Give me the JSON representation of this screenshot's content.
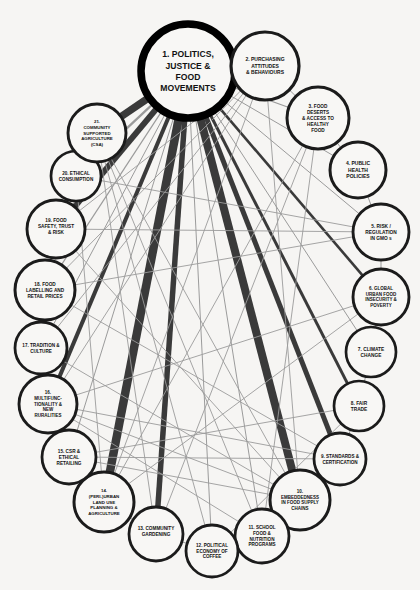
{
  "diagram": {
    "background_color": "#f6f5f3",
    "node_fill": "#f8f7f5",
    "node_stroke": "#1b1b1b",
    "hub_stroke": "#000000",
    "edge_strong_color": "#3a3a3a",
    "edge_weak_color": "#9b9b9b",
    "label_color": "#111111"
  },
  "nodes": [
    {
      "id": 1,
      "label": "1. POLITICS, JUSTICE & FOOD MOVEMENTS",
      "lines": [
        "1. POLITICS,",
        "JUSTICE &",
        "FOOD",
        "MOVEMENTS"
      ],
      "x": 188,
      "y": 71,
      "r": 47,
      "stroke_width": 7.5,
      "font_size": 8.6,
      "hub": true
    },
    {
      "id": 2,
      "label": "2. PURCHASING ATTITUDES & BEHAVIOURS",
      "lines": [
        "2. PURCHASING",
        "ATTITUDES",
        "& BEHAVIOURS"
      ],
      "x": 265,
      "y": 66,
      "r": 34,
      "stroke_width": 3.2,
      "font_size": 5.0,
      "hub": false
    },
    {
      "id": 3,
      "label": "3. FOOD DESERTS & ACCESS TO HEALTHY FOOD",
      "lines": [
        "3. FOOD",
        "DESERTS",
        "& ACCESS TO",
        "HEALTHY",
        "FOOD"
      ],
      "x": 318,
      "y": 118,
      "r": 31,
      "stroke_width": 3.0,
      "font_size": 4.7,
      "hub": false
    },
    {
      "id": 4,
      "label": "4. PUBLIC HEALTH POLICIES",
      "lines": [
        "4. PUBLIC",
        "HEALTH",
        "POLICIES"
      ],
      "x": 358,
      "y": 170,
      "r": 28,
      "stroke_width": 3.0,
      "font_size": 5.0,
      "hub": false
    },
    {
      "id": 5,
      "label": "5. RISK / REGULATION IN GMO s",
      "lines": [
        "5. RISK /",
        "REGULATION",
        "IN GMO s"
      ],
      "x": 381,
      "y": 232,
      "r": 28,
      "stroke_width": 2.9,
      "font_size": 4.8,
      "hub": false
    },
    {
      "id": 6,
      "label": "6. GLOBAL URBAN FOOD INSECURITY & POVERTY",
      "lines": [
        "6. GLOBAL",
        "URBAN FOOD",
        "INSECURITY &",
        "POVERTY"
      ],
      "x": 381,
      "y": 297,
      "r": 28,
      "stroke_width": 2.9,
      "font_size": 4.5,
      "hub": false
    },
    {
      "id": 7,
      "label": "7. CLIMATE CHANGE",
      "lines": [
        "7. CLIMATE",
        "CHANGE"
      ],
      "x": 371,
      "y": 352,
      "r": 25,
      "stroke_width": 2.7,
      "font_size": 4.8,
      "hub": false
    },
    {
      "id": 8,
      "label": "8. FAIR TRADE",
      "lines": [
        "8. FAIR",
        "TRADE"
      ],
      "x": 359,
      "y": 406,
      "r": 25,
      "stroke_width": 2.7,
      "font_size": 4.8,
      "hub": false
    },
    {
      "id": 9,
      "label": "9. STANDARDS & CERTIFICATION",
      "lines": [
        "9. STANDARDS &",
        "CERTIFICATION"
      ],
      "x": 340,
      "y": 459,
      "r": 26,
      "stroke_width": 2.8,
      "font_size": 4.6,
      "hub": false
    },
    {
      "id": 10,
      "label": "10. EMBEDDEDNESS IN FOOD SUPPLY CHAINS",
      "lines": [
        "10.",
        "EMBEDDEDNESS",
        "IN FOOD SUPPLY",
        "CHAINS"
      ],
      "x": 300,
      "y": 500,
      "r": 30,
      "stroke_width": 3.0,
      "font_size": 4.5,
      "hub": false
    },
    {
      "id": 11,
      "label": "11. SCHOOL FOOD & NUTRITION PROGRAMS",
      "lines": [
        "11. SCHOOL",
        "FOOD &",
        "NUTRITION",
        "PROGRAMS"
      ],
      "x": 262,
      "y": 536,
      "r": 27,
      "stroke_width": 2.8,
      "font_size": 4.6,
      "hub": false
    },
    {
      "id": 12,
      "label": "12. POLITICAL ECONOMY OF COFFEE",
      "lines": [
        "12. POLITICAL",
        "ECONOMY OF",
        "COFFEE"
      ],
      "x": 212,
      "y": 551,
      "r": 26,
      "stroke_width": 2.8,
      "font_size": 4.6,
      "hub": false
    },
    {
      "id": 13,
      "label": "13. COMMUNITY GARDENING",
      "lines": [
        "13. COMMUNITY",
        "GARDENING",
        ""
      ],
      "x": 156,
      "y": 534,
      "r": 27,
      "stroke_width": 2.8,
      "font_size": 4.7,
      "hub": false
    },
    {
      "id": 14,
      "label": "14. (PERI-)URBAN LAND USE PLANNING & AGRICULTURE",
      "lines": [
        "14.",
        "(PERI-)URBAN",
        "LAND USE",
        "PLANNING &",
        "AGRICULTURE"
      ],
      "x": 104,
      "y": 502,
      "r": 30,
      "stroke_width": 3.0,
      "font_size": 4.4,
      "hub": false
    },
    {
      "id": 15,
      "label": "15. CSR & ETHICAL RETAILING",
      "lines": [
        "15. CSR &",
        "ETHICAL",
        "RETAILING"
      ],
      "x": 69,
      "y": 457,
      "r": 27,
      "stroke_width": 2.8,
      "font_size": 4.7,
      "hub": false
    },
    {
      "id": 16,
      "label": "16. MULTIFUNCTIONALITY & NEW RURALITIES",
      "lines": [
        "16.",
        "MULTIFUNC-",
        "TIONALITY &",
        "NEW",
        "RURALITIES"
      ],
      "x": 48,
      "y": 404,
      "r": 29,
      "stroke_width": 2.9,
      "font_size": 4.5,
      "hub": false
    },
    {
      "id": 17,
      "label": "17. TRADITION & CULTURE",
      "lines": [
        "17. TRADITION &",
        "CULTURE"
      ],
      "x": 41,
      "y": 348,
      "r": 26,
      "stroke_width": 2.8,
      "font_size": 4.6,
      "hub": false
    },
    {
      "id": 18,
      "label": "18. FOOD LABELLING AND RETAIL PRICES",
      "lines": [
        "18. FOOD",
        "LABELLING AND",
        "RETAIL PRICES"
      ],
      "x": 45,
      "y": 290,
      "r": 30,
      "stroke_width": 3.0,
      "font_size": 4.7,
      "hub": false
    },
    {
      "id": 19,
      "label": "19. FOOD SAFETY, TRUST & RISK",
      "lines": [
        "19. FOOD",
        "SAFETY, TRUST",
        "& RISK",
        ""
      ],
      "x": 56,
      "y": 229,
      "r": 29,
      "stroke_width": 2.9,
      "font_size": 4.7,
      "hub": false
    },
    {
      "id": 20,
      "label": "20. ETHICAL CONSUMPTION",
      "lines": [
        "20. ETHICAL",
        "CONSUMPTION"
      ],
      "x": 76,
      "y": 176,
      "r": 25,
      "stroke_width": 2.7,
      "font_size": 4.6,
      "hub": false
    },
    {
      "id": 21,
      "label": "21. COMMUNITY SUPPORTED AGRICULTURE (CSA)",
      "lines": [
        "21.",
        "COMMUNITY",
        "SUPPORTED",
        "AGRICULTURE",
        "(CSA)"
      ],
      "x": 97,
      "y": 133,
      "r": 29,
      "stroke_width": 2.9,
      "font_size": 4.4,
      "hub": false
    }
  ],
  "edges": [
    {
      "source": 1,
      "target": 21,
      "weight": 7.5,
      "class": "strong"
    },
    {
      "source": 1,
      "target": 20,
      "weight": 2.2,
      "class": "weak"
    },
    {
      "source": 1,
      "target": 19,
      "weight": 6.0,
      "class": "strong"
    },
    {
      "source": 1,
      "target": 18,
      "weight": 1.2,
      "class": "weak"
    },
    {
      "source": 1,
      "target": 17,
      "weight": 1.0,
      "class": "weak"
    },
    {
      "source": 1,
      "target": 16,
      "weight": 4.0,
      "class": "strong"
    },
    {
      "source": 1,
      "target": 15,
      "weight": 1.0,
      "class": "weak"
    },
    {
      "source": 1,
      "target": 14,
      "weight": 8.5,
      "class": "strong"
    },
    {
      "source": 1,
      "target": 13,
      "weight": 5.5,
      "class": "strong"
    },
    {
      "source": 1,
      "target": 12,
      "weight": 1.0,
      "class": "weak"
    },
    {
      "source": 1,
      "target": 11,
      "weight": 1.0,
      "class": "weak"
    },
    {
      "source": 1,
      "target": 10,
      "weight": 8.0,
      "class": "strong"
    },
    {
      "source": 1,
      "target": 9,
      "weight": 5.0,
      "class": "strong"
    },
    {
      "source": 1,
      "target": 8,
      "weight": 3.0,
      "class": "strong"
    },
    {
      "source": 1,
      "target": 7,
      "weight": 1.0,
      "class": "weak"
    },
    {
      "source": 1,
      "target": 6,
      "weight": 2.6,
      "class": "strong"
    },
    {
      "source": 1,
      "target": 5,
      "weight": 1.0,
      "class": "weak"
    },
    {
      "source": 1,
      "target": 4,
      "weight": 1.0,
      "class": "weak"
    },
    {
      "source": 1,
      "target": 3,
      "weight": 1.2,
      "class": "weak"
    },
    {
      "source": 1,
      "target": 2,
      "weight": 3.2,
      "class": "strong"
    },
    {
      "source": 2,
      "target": 3,
      "weight": 1.0,
      "class": "weak"
    },
    {
      "source": 3,
      "target": 4,
      "weight": 1.0,
      "class": "weak"
    },
    {
      "source": 4,
      "target": 5,
      "weight": 1.0,
      "class": "weak"
    },
    {
      "source": 5,
      "target": 6,
      "weight": 1.0,
      "class": "weak"
    },
    {
      "source": 6,
      "target": 7,
      "weight": 1.0,
      "class": "weak"
    },
    {
      "source": 7,
      "target": 8,
      "weight": 1.0,
      "class": "weak"
    },
    {
      "source": 8,
      "target": 9,
      "weight": 1.0,
      "class": "weak"
    },
    {
      "source": 9,
      "target": 10,
      "weight": 1.0,
      "class": "weak"
    },
    {
      "source": 10,
      "target": 11,
      "weight": 1.0,
      "class": "weak"
    },
    {
      "source": 11,
      "target": 12,
      "weight": 1.0,
      "class": "weak"
    },
    {
      "source": 12,
      "target": 13,
      "weight": 1.0,
      "class": "weak"
    },
    {
      "source": 13,
      "target": 14,
      "weight": 1.0,
      "class": "weak"
    },
    {
      "source": 14,
      "target": 15,
      "weight": 1.0,
      "class": "weak"
    },
    {
      "source": 15,
      "target": 16,
      "weight": 1.0,
      "class": "weak"
    },
    {
      "source": 16,
      "target": 17,
      "weight": 1.0,
      "class": "weak"
    },
    {
      "source": 17,
      "target": 18,
      "weight": 1.0,
      "class": "weak"
    },
    {
      "source": 18,
      "target": 19,
      "weight": 1.0,
      "class": "weak"
    },
    {
      "source": 19,
      "target": 20,
      "weight": 1.0,
      "class": "weak"
    },
    {
      "source": 20,
      "target": 21,
      "weight": 1.0,
      "class": "weak"
    },
    {
      "source": 2,
      "target": 14,
      "weight": 0.9,
      "class": "weak"
    },
    {
      "source": 2,
      "target": 16,
      "weight": 0.9,
      "class": "weak"
    },
    {
      "source": 2,
      "target": 18,
      "weight": 0.9,
      "class": "weak"
    },
    {
      "source": 2,
      "target": 19,
      "weight": 0.9,
      "class": "weak"
    },
    {
      "source": 2,
      "target": 10,
      "weight": 0.9,
      "class": "weak"
    },
    {
      "source": 3,
      "target": 13,
      "weight": 0.9,
      "class": "weak"
    },
    {
      "source": 3,
      "target": 14,
      "weight": 0.9,
      "class": "weak"
    },
    {
      "source": 3,
      "target": 11,
      "weight": 0.9,
      "class": "weak"
    },
    {
      "source": 5,
      "target": 18,
      "weight": 0.9,
      "class": "weak"
    },
    {
      "source": 5,
      "target": 19,
      "weight": 0.9,
      "class": "weak"
    },
    {
      "source": 6,
      "target": 14,
      "weight": 0.9,
      "class": "weak"
    },
    {
      "source": 6,
      "target": 16,
      "weight": 0.9,
      "class": "weak"
    },
    {
      "source": 8,
      "target": 12,
      "weight": 0.9,
      "class": "weak"
    },
    {
      "source": 8,
      "target": 15,
      "weight": 0.9,
      "class": "weak"
    },
    {
      "source": 9,
      "target": 15,
      "weight": 0.9,
      "class": "weak"
    },
    {
      "source": 9,
      "target": 16,
      "weight": 0.9,
      "class": "weak"
    },
    {
      "source": 10,
      "target": 15,
      "weight": 0.9,
      "class": "weak"
    },
    {
      "source": 10,
      "target": 16,
      "weight": 0.9,
      "class": "weak"
    },
    {
      "source": 10,
      "target": 17,
      "weight": 0.9,
      "class": "weak"
    },
    {
      "source": 11,
      "target": 21,
      "weight": 0.9,
      "class": "weak"
    },
    {
      "source": 13,
      "target": 21,
      "weight": 0.9,
      "class": "weak"
    },
    {
      "source": 20,
      "target": 14,
      "weight": 0.9,
      "class": "weak"
    },
    {
      "source": 21,
      "target": 18,
      "weight": 0.9,
      "class": "weak"
    },
    {
      "source": 21,
      "target": 10,
      "weight": 0.9,
      "class": "weak"
    },
    {
      "source": 19,
      "target": 10,
      "weight": 0.9,
      "class": "weak"
    },
    {
      "source": 17,
      "target": 2,
      "weight": 0.9,
      "class": "weak"
    },
    {
      "source": 16,
      "target": 11,
      "weight": 0.9,
      "class": "weak"
    },
    {
      "source": 18,
      "target": 9,
      "weight": 0.9,
      "class": "weak"
    },
    {
      "source": 20,
      "target": 5,
      "weight": 0.9,
      "class": "weak"
    },
    {
      "source": 12,
      "target": 21,
      "weight": 0.9,
      "class": "weak"
    }
  ]
}
